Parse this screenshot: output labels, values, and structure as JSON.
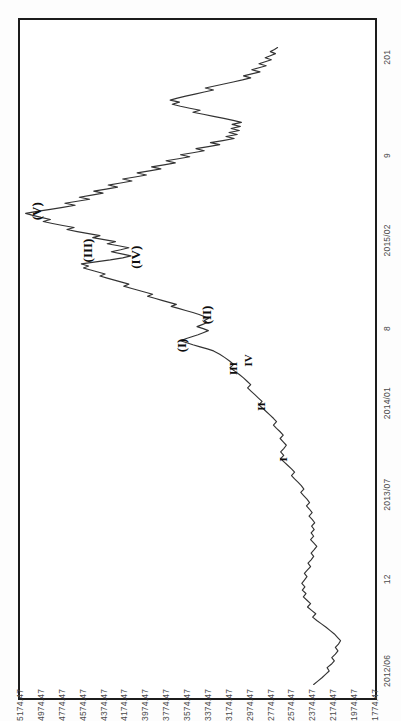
{
  "figure": {
    "orientation": "rotated-90",
    "background_color": "#ffffff",
    "frame_color": "#1c1c1c",
    "line_color": "#333333"
  },
  "chart_data": {
    "type": "line",
    "title": "",
    "subtitle": "",
    "xlabel": "",
    "ylabel": "",
    "grid": false,
    "legend_position": "none",
    "ylim": [
      1774.47,
      5174.47
    ],
    "ytick_labels": [
      "5174.47",
      "4974.47",
      "4774.47",
      "4574.47",
      "4374.47",
      "4174.47",
      "3974.47",
      "3774.47",
      "3574.47",
      "3374.47",
      "3174.47",
      "2974.47",
      "2774.47",
      "2574.47",
      "2374.47",
      "2174.47",
      "1974.47",
      "1774.47"
    ],
    "ytick_values": [
      5174.47,
      4974.47,
      4774.47,
      4574.47,
      4374.47,
      4174.47,
      3974.47,
      3774.47,
      3574.47,
      3374.47,
      3174.47,
      2974.47,
      2774.47,
      2574.47,
      2374.47,
      2174.47,
      1974.47,
      1774.47
    ],
    "xtick_labels": [
      "2012/06",
      "12",
      "2013/07",
      "2014/01",
      "8",
      "2015/02",
      "9",
      "201"
    ],
    "xtick_positions": [
      0.04,
      0.175,
      0.3,
      0.435,
      0.545,
      0.675,
      0.8,
      0.945
    ],
    "annotations": [
      {
        "text": "(I)",
        "x": 0.52,
        "y": 3620,
        "size": "major"
      },
      {
        "text": "(II)",
        "x": 0.565,
        "y": 3380,
        "size": "major"
      },
      {
        "text": "(III)",
        "x": 0.66,
        "y": 4520,
        "size": "major"
      },
      {
        "text": "(IV)",
        "x": 0.65,
        "y": 4060,
        "size": "major"
      },
      {
        "text": "(V)",
        "x": 0.718,
        "y": 5010,
        "size": "major"
      },
      {
        "text": "I",
        "x": 0.352,
        "y": 2660,
        "size": "minor"
      },
      {
        "text": "II",
        "x": 0.43,
        "y": 2870,
        "size": "minor"
      },
      {
        "text": "III",
        "x": 0.486,
        "y": 3130,
        "size": "minor"
      },
      {
        "text": "IV",
        "x": 0.498,
        "y": 2990,
        "size": "minor"
      }
    ],
    "series": [
      {
        "name": "price",
        "description": "Daily index close, 2012/06 - 2016/01, Elliott wave count",
        "points": [
          [
            0.02,
            2330
          ],
          [
            0.025,
            2290
          ],
          [
            0.03,
            2250
          ],
          [
            0.035,
            2215
          ],
          [
            0.04,
            2180
          ],
          [
            0.045,
            2200
          ],
          [
            0.05,
            2160
          ],
          [
            0.055,
            2130
          ],
          [
            0.06,
            2155
          ],
          [
            0.065,
            2120
          ],
          [
            0.07,
            2095
          ],
          [
            0.075,
            2120
          ],
          [
            0.08,
            2090
          ],
          [
            0.085,
            2070
          ],
          [
            0.09,
            2100
          ],
          [
            0.095,
            2130
          ],
          [
            0.1,
            2170
          ],
          [
            0.105,
            2210
          ],
          [
            0.11,
            2255
          ],
          [
            0.115,
            2300
          ],
          [
            0.12,
            2340
          ],
          [
            0.125,
            2310
          ],
          [
            0.13,
            2350
          ],
          [
            0.135,
            2390
          ],
          [
            0.14,
            2360
          ],
          [
            0.145,
            2395
          ],
          [
            0.15,
            2430
          ],
          [
            0.155,
            2405
          ],
          [
            0.16,
            2440
          ],
          [
            0.165,
            2415
          ],
          [
            0.17,
            2445
          ],
          [
            0.175,
            2420
          ],
          [
            0.18,
            2395
          ],
          [
            0.185,
            2420
          ],
          [
            0.19,
            2390
          ],
          [
            0.195,
            2360
          ],
          [
            0.2,
            2385
          ],
          [
            0.205,
            2355
          ],
          [
            0.21,
            2330
          ],
          [
            0.215,
            2355
          ],
          [
            0.22,
            2325
          ],
          [
            0.225,
            2300
          ],
          [
            0.23,
            2330
          ],
          [
            0.235,
            2360
          ],
          [
            0.24,
            2330
          ],
          [
            0.245,
            2355
          ],
          [
            0.25,
            2325
          ],
          [
            0.255,
            2350
          ],
          [
            0.26,
            2320
          ],
          [
            0.265,
            2345
          ],
          [
            0.27,
            2375
          ],
          [
            0.275,
            2345
          ],
          [
            0.28,
            2370
          ],
          [
            0.285,
            2400
          ],
          [
            0.29,
            2370
          ],
          [
            0.295,
            2395
          ],
          [
            0.3,
            2425
          ],
          [
            0.305,
            2455
          ],
          [
            0.31,
            2425
          ],
          [
            0.315,
            2450
          ],
          [
            0.32,
            2480
          ],
          [
            0.325,
            2515
          ],
          [
            0.33,
            2545
          ],
          [
            0.335,
            2515
          ],
          [
            0.34,
            2545
          ],
          [
            0.345,
            2580
          ],
          [
            0.35,
            2615
          ],
          [
            0.355,
            2650
          ],
          [
            0.36,
            2620
          ],
          [
            0.365,
            2650
          ],
          [
            0.37,
            2620
          ],
          [
            0.375,
            2595
          ],
          [
            0.38,
            2625
          ],
          [
            0.385,
            2655
          ],
          [
            0.39,
            2625
          ],
          [
            0.395,
            2655
          ],
          [
            0.4,
            2690
          ],
          [
            0.405,
            2720
          ],
          [
            0.41,
            2690
          ],
          [
            0.415,
            2720
          ],
          [
            0.42,
            2755
          ],
          [
            0.425,
            2790
          ],
          [
            0.43,
            2825
          ],
          [
            0.435,
            2860
          ],
          [
            0.44,
            2830
          ],
          [
            0.445,
            2865
          ],
          [
            0.45,
            2900
          ],
          [
            0.455,
            2935
          ],
          [
            0.46,
            2970
          ],
          [
            0.465,
            2940
          ],
          [
            0.47,
            2975
          ],
          [
            0.475,
            3010
          ],
          [
            0.48,
            3050
          ],
          [
            0.485,
            3095
          ],
          [
            0.49,
            3140
          ],
          [
            0.495,
            3105
          ],
          [
            0.5,
            3145
          ],
          [
            0.505,
            3190
          ],
          [
            0.51,
            3240
          ],
          [
            0.515,
            3300
          ],
          [
            0.518,
            3360
          ],
          [
            0.521,
            3430
          ],
          [
            0.524,
            3500
          ],
          [
            0.527,
            3560
          ],
          [
            0.53,
            3620
          ],
          [
            0.533,
            3570
          ],
          [
            0.536,
            3510
          ],
          [
            0.539,
            3450
          ],
          [
            0.542,
            3400
          ],
          [
            0.545,
            3350
          ],
          [
            0.548,
            3400
          ],
          [
            0.551,
            3460
          ],
          [
            0.554,
            3410
          ],
          [
            0.557,
            3360
          ],
          [
            0.56,
            3390
          ],
          [
            0.563,
            3350
          ],
          [
            0.566,
            3390
          ],
          [
            0.569,
            3440
          ],
          [
            0.572,
            3500
          ],
          [
            0.575,
            3570
          ],
          [
            0.578,
            3640
          ],
          [
            0.581,
            3710
          ],
          [
            0.584,
            3660
          ],
          [
            0.587,
            3730
          ],
          [
            0.59,
            3800
          ],
          [
            0.593,
            3870
          ],
          [
            0.596,
            3940
          ],
          [
            0.599,
            3890
          ],
          [
            0.602,
            3960
          ],
          [
            0.605,
            4030
          ],
          [
            0.608,
            4100
          ],
          [
            0.611,
            4170
          ],
          [
            0.614,
            4120
          ],
          [
            0.617,
            4190
          ],
          [
            0.62,
            4260
          ],
          [
            0.623,
            4330
          ],
          [
            0.626,
            4400
          ],
          [
            0.629,
            4350
          ],
          [
            0.632,
            4420
          ],
          [
            0.635,
            4490
          ],
          [
            0.638,
            4560
          ],
          [
            0.641,
            4510
          ],
          [
            0.644,
            4580
          ],
          [
            0.647,
            4440
          ],
          [
            0.65,
            4300
          ],
          [
            0.653,
            4180
          ],
          [
            0.656,
            4100
          ],
          [
            0.659,
            4190
          ],
          [
            0.662,
            4290
          ],
          [
            0.665,
            4200
          ],
          [
            0.668,
            4120
          ],
          [
            0.671,
            4220
          ],
          [
            0.674,
            4330
          ],
          [
            0.677,
            4250
          ],
          [
            0.68,
            4360
          ],
          [
            0.683,
            4470
          ],
          [
            0.686,
            4400
          ],
          [
            0.689,
            4510
          ],
          [
            0.692,
            4620
          ],
          [
            0.695,
            4720
          ],
          [
            0.698,
            4650
          ],
          [
            0.701,
            4760
          ],
          [
            0.704,
            4860
          ],
          [
            0.707,
            4950
          ],
          [
            0.71,
            4880
          ],
          [
            0.713,
            4970
          ],
          [
            0.716,
            5050
          ],
          [
            0.719,
            5120
          ],
          [
            0.722,
            5010
          ],
          [
            0.725,
            4880
          ],
          [
            0.728,
            4760
          ],
          [
            0.731,
            4640
          ],
          [
            0.734,
            4740
          ],
          [
            0.737,
            4620
          ],
          [
            0.74,
            4500
          ],
          [
            0.743,
            4600
          ],
          [
            0.746,
            4480
          ],
          [
            0.749,
            4370
          ],
          [
            0.752,
            4460
          ],
          [
            0.755,
            4340
          ],
          [
            0.758,
            4230
          ],
          [
            0.761,
            4320
          ],
          [
            0.764,
            4200
          ],
          [
            0.767,
            4090
          ],
          [
            0.77,
            4180
          ],
          [
            0.773,
            4060
          ],
          [
            0.776,
            3950
          ],
          [
            0.779,
            4040
          ],
          [
            0.782,
            3920
          ],
          [
            0.785,
            3810
          ],
          [
            0.788,
            3900
          ],
          [
            0.791,
            3780
          ],
          [
            0.794,
            3670
          ],
          [
            0.797,
            3760
          ],
          [
            0.8,
            3640
          ],
          [
            0.803,
            3530
          ],
          [
            0.806,
            3620
          ],
          [
            0.809,
            3500
          ],
          [
            0.812,
            3390
          ],
          [
            0.815,
            3470
          ],
          [
            0.818,
            3350
          ],
          [
            0.821,
            3240
          ],
          [
            0.824,
            3330
          ],
          [
            0.827,
            3210
          ],
          [
            0.83,
            3100
          ],
          [
            0.833,
            3180
          ],
          [
            0.836,
            3070
          ],
          [
            0.839,
            3150
          ],
          [
            0.842,
            3050
          ],
          [
            0.845,
            3130
          ],
          [
            0.848,
            3040
          ],
          [
            0.851,
            3120
          ],
          [
            0.854,
            3030
          ],
          [
            0.857,
            3110
          ],
          [
            0.86,
            3200
          ],
          [
            0.863,
            3300
          ],
          [
            0.866,
            3400
          ],
          [
            0.869,
            3500
          ],
          [
            0.872,
            3430
          ],
          [
            0.875,
            3530
          ],
          [
            0.878,
            3620
          ],
          [
            0.881,
            3700
          ],
          [
            0.884,
            3630
          ],
          [
            0.887,
            3720
          ],
          [
            0.89,
            3650
          ],
          [
            0.893,
            3570
          ],
          [
            0.896,
            3480
          ],
          [
            0.899,
            3390
          ],
          [
            0.902,
            3300
          ],
          [
            0.905,
            3380
          ],
          [
            0.908,
            3290
          ],
          [
            0.911,
            3200
          ],
          [
            0.914,
            3110
          ],
          [
            0.917,
            3020
          ],
          [
            0.92,
            2940
          ],
          [
            0.923,
            3010
          ],
          [
            0.926,
            2930
          ],
          [
            0.929,
            2850
          ],
          [
            0.932,
            2930
          ],
          [
            0.935,
            2860
          ],
          [
            0.938,
            2790
          ],
          [
            0.941,
            2860
          ],
          [
            0.944,
            2800
          ],
          [
            0.947,
            2740
          ],
          [
            0.95,
            2800
          ],
          [
            0.953,
            2750
          ],
          [
            0.956,
            2700
          ],
          [
            0.959,
            2750
          ],
          [
            0.962,
            2710
          ],
          [
            0.965,
            2680
          ]
        ]
      }
    ]
  }
}
